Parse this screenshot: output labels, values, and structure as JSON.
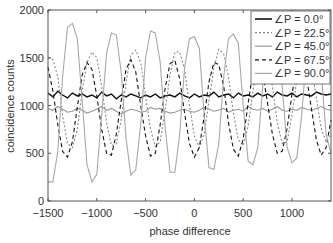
{
  "chart_data": {
    "type": "line",
    "title": "",
    "xlabel": "phase difference",
    "ylabel": "coincidence counts",
    "xlim": [
      -1500,
      1400
    ],
    "ylim": [
      0,
      2000
    ],
    "xticks": [
      -1500,
      -1000,
      -500,
      0,
      500,
      1000
    ],
    "xtick_labels": [
      "−1500",
      "−1000",
      "−500",
      "0",
      "500",
      "1000"
    ],
    "yticks": [
      0,
      500,
      1000,
      1500,
      2000
    ],
    "ytick_labels": [
      "0",
      "500",
      "1000",
      "1500",
      "2000"
    ],
    "grid": false,
    "legend_position": "upper right",
    "x": [
      -1500,
      -1450,
      -1400,
      -1350,
      -1300,
      -1250,
      -1200,
      -1150,
      -1100,
      -1050,
      -1000,
      -950,
      -900,
      -850,
      -800,
      -750,
      -700,
      -650,
      -600,
      -550,
      -500,
      -450,
      -400,
      -350,
      -300,
      -250,
      -200,
      -150,
      -100,
      -50,
      0,
      50,
      100,
      150,
      200,
      250,
      300,
      350,
      400,
      450,
      500,
      550,
      600,
      650,
      700,
      750,
      800,
      850,
      900,
      950,
      1000,
      1050,
      1100,
      1150,
      1200,
      1250,
      1300,
      1350,
      1400
    ],
    "series": [
      {
        "name": "∠P = 0.0°",
        "color": "#111111",
        "dash": "solid",
        "values": [
          1130,
          1090,
          1150,
          1110,
          1080,
          1130,
          1100,
          1120,
          1090,
          1110,
          1080,
          1140,
          1100,
          1120,
          1070,
          1110,
          1090,
          1120,
          1100,
          1080,
          1110,
          1090,
          1120,
          1080,
          1100,
          1110,
          1090,
          1130,
          1100,
          1080,
          1120,
          1090,
          1110,
          1100,
          1140,
          1090,
          1110,
          1120,
          1080,
          1130,
          1100,
          1110,
          1090,
          1130,
          1100,
          1120,
          1090,
          1140,
          1110,
          1100,
          1130,
          1090,
          1120,
          1110,
          1100,
          1140,
          1120,
          1110,
          1120
        ]
      },
      {
        "name": "∠P = 22.5°",
        "color": "#888888",
        "dash": "2,2",
        "values": [
          1500,
          1480,
          1300,
          900,
          600,
          560,
          750,
          1150,
          1450,
          1560,
          1500,
          1200,
          820,
          580,
          600,
          850,
          1250,
          1530,
          1580,
          1450,
          1100,
          750,
          570,
          620,
          950,
          1320,
          1560,
          1560,
          1380,
          1000,
          680,
          560,
          700,
          1050,
          1400,
          1590,
          1540,
          1300,
          920,
          640,
          580,
          780,
          1150,
          1450,
          1580,
          1500,
          1200,
          820,
          600,
          620,
          900,
          1280,
          1520,
          1550,
          1400,
          1080,
          760,
          620,
          700
        ]
      },
      {
        "name": "∠P = 45.0°",
        "color": "#999999",
        "dash": "solid",
        "values": [
          970,
          950,
          990,
          960,
          930,
          940,
          970,
          950,
          920,
          940,
          960,
          990,
          950,
          970,
          940,
          910,
          940,
          960,
          950,
          930,
          940,
          980,
          960,
          970,
          940,
          920,
          930,
          950,
          960,
          940,
          930,
          950,
          980,
          960,
          940,
          950,
          970,
          930,
          950,
          960,
          940,
          990,
          960,
          950,
          970,
          940,
          960,
          990,
          950,
          940,
          960,
          950,
          980,
          960,
          950,
          970,
          990,
          960,
          950
        ]
      },
      {
        "name": "∠P = 67.5°",
        "color": "#111111",
        "dash": "4,3",
        "values": [
          1400,
          1150,
          800,
          520,
          460,
          620,
          980,
          1320,
          1450,
          1380,
          1100,
          750,
          500,
          480,
          700,
          1050,
          1380,
          1480,
          1350,
          1000,
          680,
          470,
          500,
          800,
          1180,
          1440,
          1470,
          1280,
          920,
          600,
          460,
          560,
          880,
          1250,
          1450,
          1430,
          1200,
          820,
          540,
          470,
          650,
          1020,
          1350,
          1460,
          1340,
          1020,
          700,
          500,
          520,
          760,
          1120,
          1400,
          1450,
          1300,
          960,
          640,
          480,
          560,
          850
        ]
      },
      {
        "name": "∠P = 90.0°",
        "color": "#a8a8a8",
        "dash": "solid",
        "values": [
          200,
          200,
          520,
          1300,
          1820,
          1860,
          1700,
          1050,
          380,
          200,
          280,
          900,
          1550,
          1760,
          1740,
          1350,
          650,
          270,
          330,
          800,
          1500,
          1780,
          1760,
          1450,
          780,
          300,
          300,
          700,
          1400,
          1700,
          1720,
          1600,
          900,
          350,
          330,
          600,
          1300,
          1700,
          1750,
          1650,
          1000,
          420,
          380,
          560,
          1200,
          1650,
          1760,
          1700,
          1200,
          560,
          400,
          450,
          900,
          1550,
          1760,
          1740,
          1350,
          700,
          500
        ]
      }
    ]
  }
}
